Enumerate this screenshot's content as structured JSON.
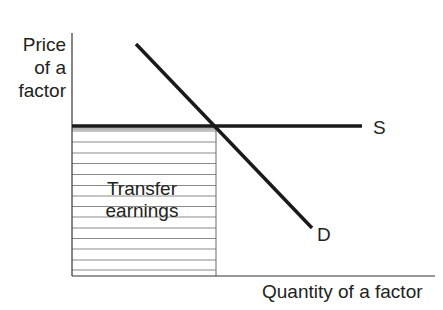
{
  "diagram": {
    "type": "economics supply-demand diagram",
    "axes": {
      "y_label_lines": [
        "Price",
        "of a",
        "factor"
      ],
      "x_label": "Quantity of a factor"
    },
    "curves": [
      {
        "name": "S",
        "label": "S",
        "shape": "horizontal line (perfectly elastic supply)",
        "color": "#1a1a1a"
      },
      {
        "name": "D",
        "label": "D",
        "shape": "downward-sloping line",
        "color": "#1a1a1a"
      }
    ],
    "shaded_area": {
      "label_lines": [
        "Transfer",
        "earnings"
      ],
      "fill": "horizontal hatching",
      "bounds": "from origin to equilibrium quantity, from 0 to supply price"
    },
    "colors": {
      "background": "#ffffff",
      "lines": "#1a1a1a",
      "hatch": "#8a8a8a",
      "text": "#222222"
    }
  }
}
